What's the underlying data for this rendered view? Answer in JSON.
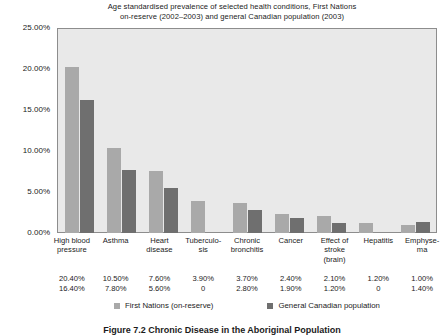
{
  "chart_data": {
    "type": "bar",
    "title": "Age standardised prevalence of selected health conditions, First Nations on-reserve (2002–2003) and general Canadian population (2003)",
    "title_line1": "Age standardised prevalence of selected health conditions, First Nations",
    "title_line2": "on-reserve (2002–2003) and general Canadian population (2003)",
    "xlabel": "",
    "ylabel": "",
    "ylim": [
      0,
      25
    ],
    "ytick_labels": [
      "0.00%",
      "5.00%",
      "10.00%",
      "15.00%",
      "20.00%",
      "25.00%"
    ],
    "ytick_values": [
      0,
      5,
      10,
      15,
      20,
      25
    ],
    "grid": false,
    "legend_position": "bottom",
    "categories": [
      "High blood pressure",
      "Asthma",
      "Heart disease",
      "Tuberculo-sis",
      "Chronic bronchitis",
      "Cancer",
      "Effect of stroke (brain)",
      "Hepatitis",
      "Emphyse-ma"
    ],
    "series": [
      {
        "name": "First Nations (on-reserve)",
        "color": "#a9a9a9",
        "values": [
          20.4,
          10.5,
          7.6,
          3.9,
          3.7,
          2.4,
          2.1,
          1.2,
          1.0
        ],
        "labels": [
          "20.40%",
          "10.50%",
          "7.60%",
          "3.90%",
          "3.70%",
          "2.40%",
          "2.10%",
          "1.20%",
          "1.00%"
        ]
      },
      {
        "name": "General Canadian population",
        "color": "#6f6f6f",
        "values": [
          16.4,
          7.8,
          5.6,
          0,
          2.8,
          1.9,
          1.2,
          0,
          1.4
        ],
        "labels": [
          "16.40%",
          "7.80%",
          "5.60%",
          "0",
          "2.80%",
          "1.90%",
          "1.20%",
          "0",
          "1.40%"
        ]
      }
    ]
  },
  "caption": "Figure 7.2 Chronic Disease in the Aboriginal Population",
  "colors": {
    "series_light": "#a9a9a9",
    "series_dark": "#6f6f6f",
    "plot_background": "#e9e9e9",
    "plot_border": "#8d8d8d",
    "text": "#1b1b1b"
  }
}
